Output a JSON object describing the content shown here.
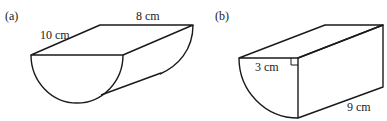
{
  "figures": [
    {
      "id": "a",
      "label": "(a)",
      "shape": "half-cylinder lying on its flat face, curved side down",
      "dimensions": {
        "length_label": "10 cm",
        "width_label": "8 cm"
      }
    },
    {
      "id": "b",
      "label": "(b)",
      "shape": "quarter-cylinder prism with right angle at top",
      "dimensions": {
        "radius_label": "3 cm",
        "length_label": "9 cm"
      },
      "right_angle_marker": true
    }
  ]
}
